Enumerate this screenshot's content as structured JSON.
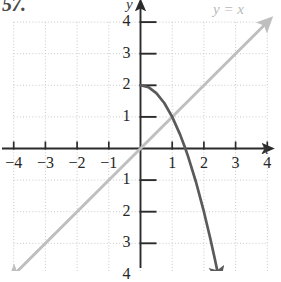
{
  "figure": {
    "exercise_number": "57.",
    "x_axis_label": "x",
    "y_axis_label": "y"
  },
  "chart_data": {
    "type": "line",
    "title": "",
    "xlabel": "x",
    "ylabel": "y",
    "xlim": [
      -4.5,
      4.3
    ],
    "ylim": [
      -4.3,
      4.3
    ],
    "grid": true,
    "grid_spacing": 1,
    "legend_position": "top-right",
    "x_ticks": [
      -4,
      -3,
      -2,
      -1,
      1,
      2,
      3,
      4
    ],
    "y_ticks": [
      4,
      3,
      2,
      1,
      -1,
      -2,
      -3,
      -4
    ],
    "x_tick_labels": [
      "−4",
      "−3",
      "−2",
      "−1",
      "1",
      "2",
      "3",
      "4"
    ],
    "y_tick_labels": [
      "4",
      "3",
      "2",
      "1",
      "1",
      "2",
      "3",
      "4"
    ],
    "series": [
      {
        "name": "y = x",
        "label": "y = x",
        "color": "#bfbfbf",
        "style": "solid-line-with-arrows",
        "points": [
          [
            -4,
            -4
          ],
          [
            4,
            4
          ]
        ]
      },
      {
        "name": "curve",
        "label": "",
        "color": "#5a5a5a",
        "style": "solid-curve-with-arrow",
        "points": [
          [
            0,
            2
          ],
          [
            0.25,
            1.94
          ],
          [
            0.5,
            1.75
          ],
          [
            0.75,
            1.44
          ],
          [
            1,
            1
          ],
          [
            1.25,
            0.44
          ],
          [
            1.4,
            0.04
          ],
          [
            1.5,
            -0.25
          ],
          [
            1.75,
            -1.06
          ],
          [
            2,
            -2
          ],
          [
            2.2,
            -2.84
          ],
          [
            2.35,
            -3.52
          ],
          [
            2.45,
            -4
          ]
        ]
      }
    ],
    "y_tick_labels_negative_sign": "minus-sign-drawn-as-tick"
  }
}
